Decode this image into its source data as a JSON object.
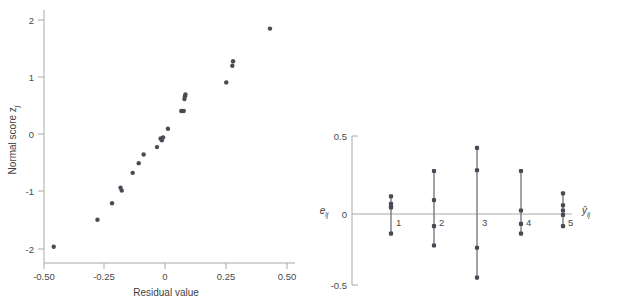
{
  "figure": {
    "background_color": "#ffffff",
    "marker_color": "#4a4a54",
    "axis_color": "#a8a8a8",
    "text_color": "#4a4a4a"
  },
  "chart_data": [
    {
      "type": "scatter",
      "panel": "left",
      "title": "",
      "xlabel": "Residual value",
      "ylabel": "Normal score zⱼ",
      "ylabel_base": "Normal score z",
      "ylabel_sub": "j",
      "xlim": [
        -0.58,
        0.56
      ],
      "ylim": [
        -2.25,
        2.3
      ],
      "xticks": [
        -0.5,
        -0.25,
        0,
        0.25,
        0.5
      ],
      "xticklabels": [
        "-0.50",
        "-0.25",
        "0",
        "0.25",
        "0.50"
      ],
      "yticks": [
        -2,
        -1,
        0,
        1,
        2
      ],
      "yticklabels": [
        "-2",
        "-1",
        "0",
        "1",
        "2"
      ],
      "grid": false,
      "legend": "none",
      "x": [
        -0.46,
        -0.28,
        -0.22,
        -0.185,
        -0.18,
        -0.135,
        -0.11,
        -0.09,
        -0.035,
        -0.02,
        -0.015,
        -0.01,
        0.01,
        0.065,
        0.075,
        0.078,
        0.08,
        0.082,
        0.25,
        0.275,
        0.278,
        0.43
      ],
      "y": [
        -1.96,
        -1.49,
        -1.2,
        -0.93,
        -0.98,
        -0.67,
        -0.5,
        -0.35,
        -0.22,
        -0.07,
        -0.1,
        -0.05,
        0.1,
        0.41,
        0.41,
        0.62,
        0.67,
        0.7,
        0.91,
        1.2,
        1.28,
        1.85
      ]
    },
    {
      "type": "scatter",
      "panel": "right",
      "title": "",
      "xlabel": "ŷᵢⱼ",
      "xlabel_base": "ŷ",
      "xlabel_sub": "ij",
      "ylabel": "eᵢⱼ",
      "ylabel_base": "e",
      "ylabel_sub": "ij",
      "ylim": [
        -0.5,
        0.5
      ],
      "yticks": [
        -0.5,
        0,
        0.5
      ],
      "yticklabels": [
        "-0.5",
        "0",
        "0.5"
      ],
      "xticks": [
        1,
        2,
        3,
        4,
        5
      ],
      "xticklabels": [
        "1",
        "2",
        "3",
        "4",
        "5"
      ],
      "grid": false,
      "legend": "none",
      "groups": [
        {
          "label": "1",
          "x": 1,
          "values": [
            0.095,
            0.045,
            0.025,
            0.02,
            -0.155
          ]
        },
        {
          "label": "2",
          "x": 2,
          "values": [
            0.265,
            0.07,
            -0.105,
            -0.235
          ]
        },
        {
          "label": "3",
          "x": 3,
          "values": [
            0.42,
            0.27,
            -0.25,
            -0.45
          ]
        },
        {
          "label": "4",
          "x": 4,
          "values": [
            0.265,
            0.0,
            -0.09,
            -0.155
          ]
        },
        {
          "label": "5",
          "x": 5,
          "values": [
            0.115,
            0.035,
            0.0,
            -0.03,
            -0.105
          ]
        }
      ]
    }
  ]
}
